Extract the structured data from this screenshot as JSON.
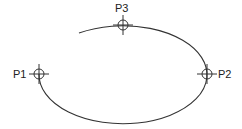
{
  "diagram": {
    "type": "ellipse-arc-through-three-points",
    "stroke_color": "#333333",
    "background": "#ffffff",
    "ellipse": {
      "cx": 123,
      "cy": 74,
      "rx": 84,
      "ry": 49,
      "arc_start": {
        "x": 79,
        "y": 33
      },
      "arc_end": {
        "x": 39,
        "y": 74
      }
    },
    "points": [
      {
        "id": "P1",
        "label": "P1",
        "x": 39,
        "y": 74,
        "label_x": 12,
        "label_y": 78
      },
      {
        "id": "P2",
        "label": "P2",
        "x": 207,
        "y": 74,
        "label_x": 216,
        "label_y": 78
      },
      {
        "id": "P3",
        "label": "P3",
        "x": 123,
        "y": 25,
        "label_x": 115,
        "label_y": 12
      }
    ]
  }
}
